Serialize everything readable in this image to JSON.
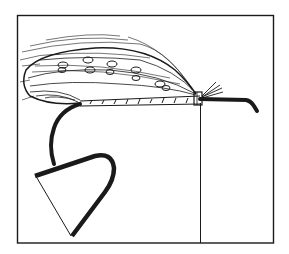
{
  "illustration": {
    "subject": "fishing-fly-diagram",
    "colors": {
      "ink": "#1a1a1a",
      "paper": "#ffffff"
    },
    "frame": {
      "x": 17,
      "y": 15,
      "width": 256,
      "height": 228
    },
    "divider_line": {
      "x": 200,
      "y1": 103,
      "y2": 243
    }
  }
}
